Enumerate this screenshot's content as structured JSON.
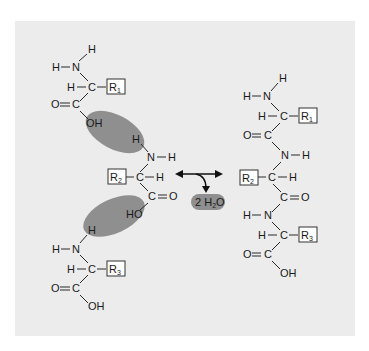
{
  "diagram": {
    "colors": {
      "panel": "#ececec",
      "highlight": "#8f8f8f",
      "text": "#1a1a1a"
    },
    "reactants": {
      "aa1": {
        "amine_h_top": "H",
        "amine_h_left": "H",
        "amine_n": "N",
        "alpha_h": "H",
        "alpha_c": "C",
        "r_group": "R",
        "r_sub": "1",
        "carbonyl_o": "O",
        "carbonyl_c": "C",
        "hydroxyl": "OH"
      },
      "aa2": {
        "amine_h_top": "H",
        "amine_n": "N",
        "amine_h_right": "H",
        "r_group": "R",
        "r_sub": "2",
        "alpha_c": "C",
        "alpha_h": "H",
        "carbonyl_c": "C",
        "carbonyl_o": "O",
        "hydroxyl": "HO"
      },
      "aa3": {
        "amine_h_top": "H",
        "amine_h_left": "H",
        "amine_n": "N",
        "alpha_h": "H",
        "alpha_c": "C",
        "r_group": "R",
        "r_sub": "3",
        "carbonyl_o": "O",
        "carbonyl_c": "C",
        "hydroxyl": "OH"
      }
    },
    "reaction": {
      "arrow": "double-headed-arrow",
      "byproduct_coef": "2",
      "byproduct_h": "H",
      "byproduct_sub": "2",
      "byproduct_o": "O"
    },
    "product": {
      "n_h_top": "H",
      "n_h_left": "H",
      "n1": "N",
      "h1": "H",
      "c1": "C",
      "r1": "R",
      "r1_sub": "1",
      "o1": "O",
      "co1": "C",
      "n2": "N",
      "nh2": "H",
      "r2": "R",
      "r2_sub": "2",
      "c2": "C",
      "h2": "H",
      "co2": "C",
      "o2": "O",
      "h3n": "H",
      "n3": "N",
      "h3": "H",
      "c3": "C",
      "r3": "R",
      "r3_sub": "3",
      "o3": "O",
      "co3": "C",
      "oh": "OH"
    }
  }
}
